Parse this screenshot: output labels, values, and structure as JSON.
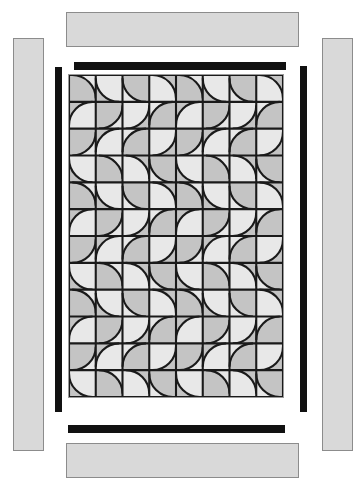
{
  "diagram": {
    "type": "quilt-construction-layout",
    "canvas": {
      "width": 364,
      "height": 485,
      "background": "#ffffff"
    }
  },
  "colors": {
    "background": "#ffffff",
    "outer_border_fill": "#d9d9d9",
    "outer_border_stroke": "#8c8c8c",
    "inner_border_fill": "#111111",
    "quilt_background": "#efefef",
    "patch_light": "#e8e8e8",
    "patch_medium": "#c4c4c4",
    "seam_line": "#1a1a1a",
    "block_outline": "#9a9a9a"
  },
  "center_block": {
    "name": "drunkards-path-quilt-center",
    "pattern_name": "Drunkard's Path",
    "columns": 8,
    "rows": 12,
    "patch_count": 96,
    "x": 68,
    "y": 74,
    "width": 216,
    "height": 324,
    "patch_size": 27
  },
  "inner_borders": [
    {
      "name": "inner-border-top",
      "label": "Inner Border Top",
      "x": 74,
      "y": 62,
      "width": 212,
      "height": 8,
      "orientation": "horizontal",
      "color": "#111111"
    },
    {
      "name": "inner-border-bottom",
      "label": "Inner Border Bottom",
      "x": 68,
      "y": 425,
      "width": 217,
      "height": 8,
      "orientation": "horizontal",
      "color": "#111111"
    },
    {
      "name": "inner-border-left",
      "label": "Inner Border Left",
      "x": 55,
      "y": 67,
      "width": 7,
      "height": 345,
      "orientation": "vertical",
      "color": "#111111"
    },
    {
      "name": "inner-border-right",
      "label": "Inner Border Right",
      "x": 300,
      "y": 66,
      "width": 7,
      "height": 346,
      "orientation": "vertical",
      "color": "#111111"
    }
  ],
  "outer_borders": [
    {
      "name": "outer-border-top",
      "label": "Outer Border Top",
      "x": 66,
      "y": 12,
      "width": 233,
      "height": 35,
      "orientation": "horizontal",
      "color": "#d9d9d9"
    },
    {
      "name": "outer-border-bottom",
      "label": "Outer Border Bottom",
      "x": 66,
      "y": 443,
      "width": 233,
      "height": 35,
      "orientation": "horizontal",
      "color": "#d9d9d9"
    },
    {
      "name": "outer-border-left",
      "label": "Outer Border Left",
      "x": 13,
      "y": 38,
      "width": 31,
      "height": 413,
      "orientation": "vertical",
      "color": "#d9d9d9"
    },
    {
      "name": "outer-border-right",
      "label": "Outer Border Right",
      "x": 322,
      "y": 38,
      "width": 31,
      "height": 413,
      "orientation": "vertical",
      "color": "#d9d9d9"
    }
  ]
}
